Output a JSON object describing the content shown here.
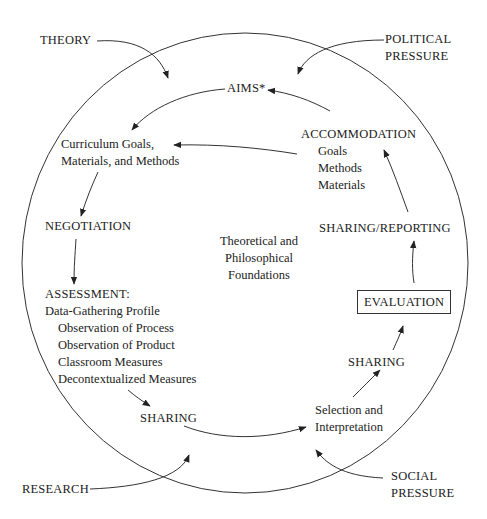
{
  "diagram": {
    "title": "",
    "outer_circle_label": "",
    "external_influences": {
      "theory": "THEORY",
      "political_pressure": [
        "POLITICAL",
        "PRESSURE"
      ],
      "research": "RESEARCH",
      "social_pressure": [
        "SOCIAL",
        "PRESSURE"
      ]
    },
    "cycle_nodes": {
      "aims": "AIMS*",
      "curriculum": [
        "Curriculum Goals,",
        "Materials, and Methods"
      ],
      "negotiation": "NEGOTIATION",
      "assessment": {
        "heading": "ASSESSMENT:",
        "subheading": "Data-Gathering Profile",
        "items": [
          "Observation of Process",
          "Observation of Product",
          "Classroom Measures",
          "Decontextualized Measures"
        ]
      },
      "sharing_1": "SHARING",
      "selection": [
        "Selection and",
        "Interpretation"
      ],
      "sharing_2": "SHARING",
      "evaluation": "EVALUATION",
      "sharing_reporting": "SHARING/REPORTING",
      "accommodation": {
        "heading": "ACCOMMODATION",
        "items": [
          "Goals",
          "Methods",
          "Materials"
        ]
      }
    },
    "center_label": [
      "Theoretical and",
      "Philosophical",
      "Foundations"
    ],
    "colors": {
      "line": "#333333",
      "text": "#222222",
      "background": "#ffffff"
    }
  }
}
